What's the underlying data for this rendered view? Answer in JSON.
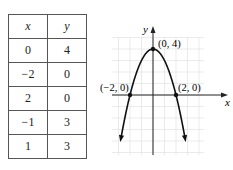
{
  "table": {
    "headers": [
      "x",
      "y"
    ],
    "rows": [
      [
        "0",
        "4"
      ],
      [
        "−2",
        "0"
      ],
      [
        "2",
        "0"
      ],
      [
        "−1",
        "3"
      ],
      [
        "1",
        "3"
      ]
    ]
  },
  "chart_data": {
    "type": "line",
    "title": "",
    "xlabel": "x",
    "ylabel": "y",
    "equation": "y = 4 - x^2",
    "grid": true,
    "xlim": [
      -3.5,
      4.5
    ],
    "ylim": [
      -5.2,
      5
    ],
    "points": [
      {
        "x": 0,
        "y": 4,
        "label": "(0, 4)"
      },
      {
        "x": -2,
        "y": 0,
        "label": "(−2, 0)"
      },
      {
        "x": 2,
        "y": 0,
        "label": "(2, 0)"
      }
    ],
    "table_points": [
      {
        "x": 0,
        "y": 4
      },
      {
        "x": -2,
        "y": 0
      },
      {
        "x": 2,
        "y": 0
      },
      {
        "x": -1,
        "y": 3
      },
      {
        "x": 1,
        "y": 3
      }
    ]
  },
  "labels": {
    "x_axis": "x",
    "y_axis": "y",
    "vertex": "(0, 4)",
    "left_intercept": "(−2, 0)",
    "right_intercept": "(2, 0)"
  }
}
